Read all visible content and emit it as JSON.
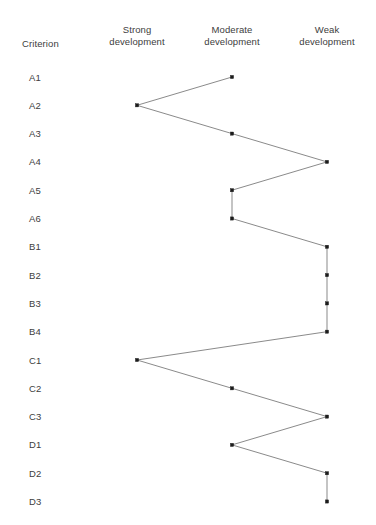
{
  "header": {
    "criterion_label": "Criterion",
    "columns": [
      {
        "id": "strong",
        "label": "Strong\ndevelopment",
        "x": 137
      },
      {
        "id": "moderate",
        "label": "Moderate\ndevelopment",
        "x": 232
      },
      {
        "id": "weak",
        "label": "Weak\ndevelopment",
        "x": 327
      }
    ]
  },
  "chart_data": {
    "type": "line",
    "title": "",
    "subtitle": "",
    "xlabel": "",
    "ylabel": "Criterion",
    "orientation": "vertical-categories",
    "grid": false,
    "legend": "none",
    "x_categories": [
      "Strong development",
      "Moderate development",
      "Weak development"
    ],
    "x_values": [
      1,
      2,
      3
    ],
    "xlim": [
      1,
      3
    ],
    "categories": [
      "A1",
      "A2",
      "A3",
      "A4",
      "A5",
      "A6",
      "B1",
      "B2",
      "B3",
      "B4",
      "C1",
      "C2",
      "C3",
      "D1",
      "D2",
      "D3"
    ],
    "values": [
      2,
      1,
      2,
      3,
      2,
      2,
      3,
      3,
      3,
      3,
      1,
      2,
      3,
      2,
      3,
      3
    ],
    "value_labels": [
      "Moderate development",
      "Strong development",
      "Moderate development",
      "Weak development",
      "Moderate development",
      "Moderate development",
      "Weak development",
      "Weak development",
      "Weak development",
      "Weak development",
      "Strong development",
      "Moderate development",
      "Weak development",
      "Moderate development",
      "Weak development",
      "Weak development"
    ],
    "series": [
      {
        "name": "Assessment profile",
        "values": [
          2,
          1,
          2,
          3,
          2,
          2,
          3,
          3,
          3,
          3,
          1,
          2,
          3,
          2,
          3,
          3
        ]
      }
    ]
  },
  "style": {
    "line_color": "#585858",
    "marker_color": "#1c1c1c",
    "text_color": "#3d3d3d",
    "background": "#ffffff"
  },
  "geometry": {
    "row_start_y": 77,
    "row_step": 28.3,
    "label_x": 29,
    "header_y": 24,
    "criterion_header_x": 22,
    "criterion_header_y": 38
  }
}
